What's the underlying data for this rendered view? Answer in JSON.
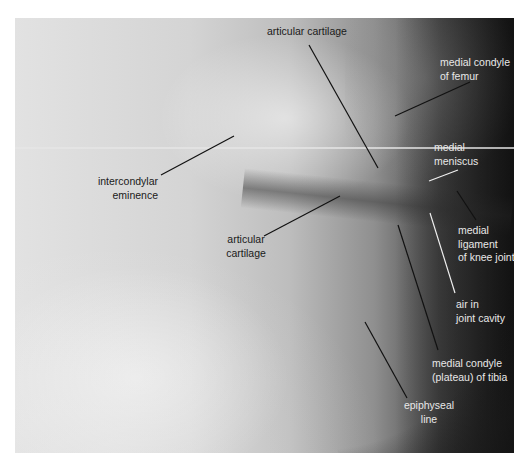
{
  "figure": {
    "colors": {
      "background": "#ffffff",
      "label_dark": "#1a1a1a",
      "label_light": "#e8e8e8",
      "leader_dark": "#111111",
      "leader_light": "#f0f0f0"
    }
  },
  "labels": {
    "articular_cartilage_top": {
      "line1": "articular cartilage"
    },
    "medial_condyle_femur": {
      "line1": "medial condyle",
      "line2": "of femur"
    },
    "medial_meniscus": {
      "line1": "medial",
      "line2": "meniscus"
    },
    "intercondylar_eminence": {
      "line1": "intercondylar",
      "line2": "eminence"
    },
    "articular_cartilage_lower": {
      "line1": "articular",
      "line2": "cartilage"
    },
    "medial_ligament": {
      "line1": "medial",
      "line2": "ligament",
      "line3": "of knee joint"
    },
    "air_joint_cavity": {
      "line1": "air in",
      "line2": "joint cavity"
    },
    "medial_condyle_tibia": {
      "line1": "medial condyle",
      "line2": "(plateau) of tibia"
    },
    "epiphyseal_line": {
      "line1": "epiphyseal",
      "line2": "line"
    }
  }
}
